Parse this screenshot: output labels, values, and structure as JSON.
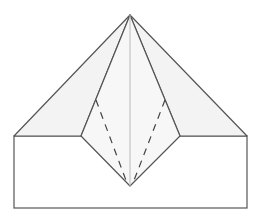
{
  "diagram": {
    "colors": {
      "background": "#ffffff",
      "outer_flap_fill": "#f3f3f3",
      "kite_fill": "#f7f7f7",
      "base_fill": "#ffffff",
      "edge_stroke": "#555555",
      "center_crease": "#bbbbbb",
      "valley_fold": "#444444"
    },
    "shapes": {
      "apex": [
        130,
        15
      ],
      "base_rect": {
        "x1": 14,
        "y1": 136,
        "x2": 247,
        "y2": 208
      },
      "left_flap": [
        [
          130,
          15
        ],
        [
          14,
          136
        ],
        [
          81,
          136
        ]
      ],
      "right_flap": [
        [
          130,
          15
        ],
        [
          247,
          136
        ],
        [
          180,
          136
        ]
      ],
      "kite": [
        [
          130,
          15
        ],
        [
          81,
          136
        ],
        [
          130,
          186
        ],
        [
          180,
          136
        ]
      ],
      "center_crease": [
        [
          130,
          15
        ],
        [
          130,
          186
        ]
      ],
      "dashed_folds": [
        [
          [
            96,
            100
          ],
          [
            127,
            183
          ]
        ],
        [
          [
            165,
            100
          ],
          [
            133,
            183
          ]
        ]
      ]
    }
  }
}
